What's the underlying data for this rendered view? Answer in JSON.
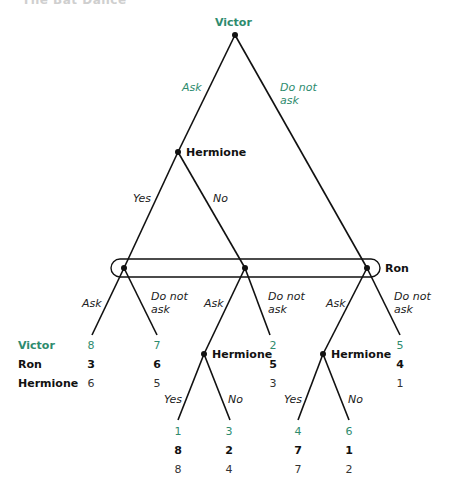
{
  "heading": "The Bat Dance",
  "colors": {
    "victor": "#2e8b6e",
    "line": "#111111"
  },
  "players": {
    "victor": "Victor",
    "hermione": "Hermione",
    "ron": "Ron"
  },
  "moves": {
    "victor_ask": "Ask",
    "victor_not_l1": "Do not",
    "victor_not_l2": "ask",
    "hermione_yes": "Yes",
    "hermione_no": "No",
    "ron1_ask": "Ask",
    "ron1_not_l1": "Do not",
    "ron1_not_l2": "ask",
    "ron2_ask": "Ask",
    "ron2_not_l1": "Do not",
    "ron2_not_l2": "ask",
    "ron3_ask": "Ask",
    "ron3_not_l1": "Do not",
    "ron3_not_l2": "ask",
    "h1_yes": "Yes",
    "h1_no": "No",
    "h2_yes": "Yes",
    "h2_no": "No"
  },
  "payoff_labels": {
    "victor": "Victor",
    "ron": "Ron",
    "hermione": "Hermione"
  },
  "payoffs": {
    "leaf1": {
      "victor": "8",
      "ron": "3",
      "hermione": "6"
    },
    "leaf2": {
      "victor": "7",
      "ron": "6",
      "hermione": "5"
    },
    "leaf3": {
      "victor": "2",
      "ron": "5",
      "hermione": "3"
    },
    "leaf4": {
      "victor": "5",
      "ron": "4",
      "hermione": "1"
    },
    "leaf5": {
      "victor": "1",
      "ron": "8",
      "hermione": "8"
    },
    "leaf6": {
      "victor": "3",
      "ron": "2",
      "hermione": "4"
    },
    "leaf7": {
      "victor": "4",
      "ron": "7",
      "hermione": "7"
    },
    "leaf8": {
      "victor": "6",
      "ron": "1",
      "hermione": "2"
    }
  }
}
